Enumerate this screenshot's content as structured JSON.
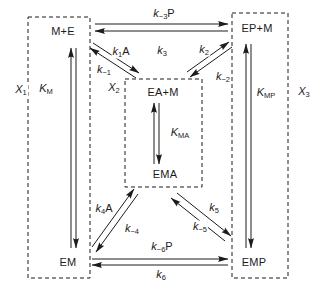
{
  "figure": {
    "states": {
      "m_plus_e": "M+E",
      "ep_plus_m": "EP+M",
      "ea_plus_m": "EA+M",
      "ema": "EMA",
      "em": "EM",
      "emp": "EMP"
    },
    "constants": {
      "k1A": {
        "base": "k",
        "sub": "1",
        "suffix": "A"
      },
      "km1": {
        "base": "k",
        "sub": "−1",
        "suffix": ""
      },
      "k2": {
        "base": "k",
        "sub": "2",
        "suffix": ""
      },
      "km2": {
        "base": "k",
        "sub": "−2",
        "suffix": ""
      },
      "k3": {
        "base": "k",
        "sub": "3",
        "suffix": ""
      },
      "km3P": {
        "base": "k",
        "sub": "−3",
        "suffix": "P"
      },
      "k4A": {
        "base": "k",
        "sub": "4",
        "suffix": "A"
      },
      "km4": {
        "base": "k",
        "sub": "−4",
        "suffix": ""
      },
      "k5": {
        "base": "k",
        "sub": "5",
        "suffix": ""
      },
      "km5": {
        "base": "k",
        "sub": "−5",
        "suffix": ""
      },
      "k6": {
        "base": "k",
        "sub": "6",
        "suffix": ""
      },
      "km6P": {
        "base": "k",
        "sub": "−6",
        "suffix": "P"
      },
      "KM": {
        "base": "K",
        "sub": "M",
        "suffix": ""
      },
      "KMA": {
        "base": "K",
        "sub": "MA",
        "suffix": ""
      },
      "KMP": {
        "base": "K",
        "sub": "MP",
        "suffix": ""
      }
    },
    "mole_fractions": {
      "X1": {
        "base": "X",
        "sub": "1"
      },
      "X2": {
        "base": "X",
        "sub": "2"
      },
      "X3": {
        "base": "X",
        "sub": "3"
      }
    },
    "colors": {
      "ink": "#1c1c1c",
      "background": "#ffffff"
    }
  }
}
